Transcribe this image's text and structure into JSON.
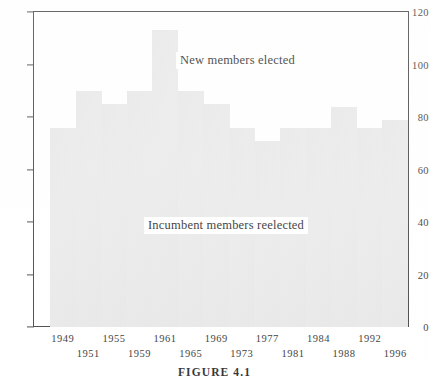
{
  "figure": {
    "caption": "FIGURE 4.1"
  },
  "annotations": {
    "upper": "New members elected",
    "lower": "Incumbent members reelected"
  },
  "colors": {
    "bar_fill": "#e9e9e9",
    "axis": "#3a3a3a",
    "text": "#1a1a1a",
    "background": "#ffffff"
  },
  "chart_data": {
    "type": "bar",
    "title": "FIGURE 4.1",
    "xlabel": "",
    "ylabel": "",
    "ylim": [
      0,
      120
    ],
    "ytick_values": [
      0,
      20,
      40,
      60,
      80,
      100,
      120
    ],
    "ytick_labels": [
      "0",
      "20",
      "40",
      "60",
      "80",
      "100",
      "120"
    ],
    "grid": false,
    "legend": "none",
    "bar_gap": 0,
    "categories": [
      "1949",
      "1951",
      "1955",
      "1959",
      "1961",
      "1965",
      "1969",
      "1973",
      "1977",
      "1981",
      "1984",
      "1988",
      "1992",
      "1996"
    ],
    "xtick_labels": [
      {
        "label": "1949",
        "row": "top"
      },
      {
        "label": "1951",
        "row": "bottom"
      },
      {
        "label": "1955",
        "row": "top"
      },
      {
        "label": "1959",
        "row": "bottom"
      },
      {
        "label": "1961",
        "row": "top"
      },
      {
        "label": "1965",
        "row": "bottom"
      },
      {
        "label": "1969",
        "row": "top"
      },
      {
        "label": "1973",
        "row": "bottom"
      },
      {
        "label": "1977",
        "row": "top"
      },
      {
        "label": "1981",
        "row": "bottom"
      },
      {
        "label": "1984",
        "row": "top"
      },
      {
        "label": "1988",
        "row": "bottom"
      },
      {
        "label": "1992",
        "row": "top"
      },
      {
        "label": "1996",
        "row": "bottom"
      }
    ],
    "values": [
      76,
      90,
      85,
      90,
      113,
      90,
      85,
      76,
      71,
      76,
      76,
      84,
      76,
      79
    ],
    "series": [
      {
        "name": "New members elected",
        "values": [
          76,
          90,
          85,
          90,
          113,
          90,
          85,
          76,
          71,
          76,
          76,
          84,
          76,
          79
        ]
      }
    ],
    "annotations": [
      {
        "text": "New members elected",
        "region": "upper"
      },
      {
        "text": "Incumbent members reelected",
        "region": "lower"
      }
    ]
  }
}
